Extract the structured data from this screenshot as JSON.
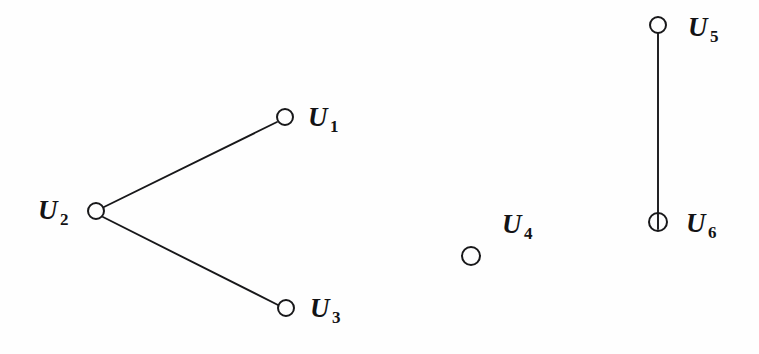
{
  "figure": {
    "kind": "graph-diagram",
    "width": 759,
    "height": 354,
    "background_color": "#fefefe",
    "ink_color": "#18181a",
    "edge_count": 3,
    "vertex_count": 6
  },
  "vertices": [
    {
      "id": "U1",
      "base": "U",
      "subscript": "1",
      "cx": 285,
      "cy": 117,
      "r": 9,
      "label_x": 308,
      "label_y": 104,
      "label_position": "right",
      "isolated": false
    },
    {
      "id": "U2",
      "base": "U",
      "subscript": "2",
      "cx": 96,
      "cy": 211,
      "r": 9,
      "label_x": 38,
      "label_y": 197,
      "label_position": "left",
      "isolated": false
    },
    {
      "id": "U3",
      "base": "U",
      "subscript": "3",
      "cx": 286,
      "cy": 308,
      "r": 9,
      "label_x": 310,
      "label_y": 295,
      "label_position": "right",
      "isolated": false
    },
    {
      "id": "U4",
      "base": "U",
      "subscript": "4",
      "cx": 471,
      "cy": 256,
      "r": 10,
      "label_x": 502,
      "label_y": 211,
      "label_position": "above-right",
      "isolated": true
    },
    {
      "id": "U5",
      "base": "U",
      "subscript": "5",
      "cx": 658,
      "cy": 25,
      "r": 9,
      "label_x": 688,
      "label_y": 14,
      "label_position": "right",
      "isolated": false
    },
    {
      "id": "U6",
      "base": "U",
      "subscript": "6",
      "cx": 658,
      "cy": 222,
      "r": 10,
      "label_x": 686,
      "label_y": 210,
      "label_position": "right",
      "isolated": false
    }
  ],
  "edges": [
    {
      "id": "edge-u2-u1",
      "from": "U2",
      "to": "U1",
      "x1": 104,
      "y1": 207,
      "x2": 277,
      "y2": 122,
      "width": 1.9
    },
    {
      "id": "edge-u2-u3",
      "from": "U2",
      "to": "U3",
      "x1": 103,
      "y1": 217,
      "x2": 278,
      "y2": 305,
      "width": 1.9
    },
    {
      "id": "edge-u5-u6",
      "from": "U5",
      "to": "U6",
      "x1": 658,
      "y1": 33,
      "x2": 658,
      "y2": 229,
      "width": 1.9
    }
  ]
}
